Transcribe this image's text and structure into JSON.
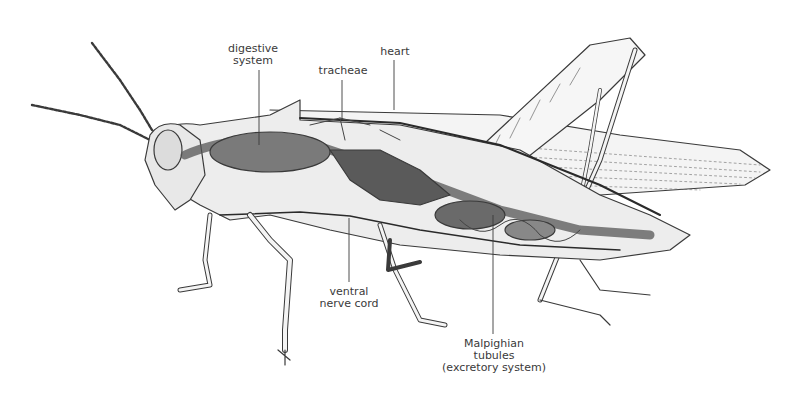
{
  "diagram": {
    "colors": {
      "background": "#ffffff",
      "ink": "#3a3a3a",
      "organ_dark": "#4a4a4a",
      "organ_mid": "#8a8a8a",
      "body_fill": "#efefef"
    },
    "labels": [
      {
        "id": "digestive",
        "lines": [
          "digestive",
          "system"
        ],
        "x": 253,
        "y": 43,
        "leader": {
          "x1": 259,
          "y1": 70,
          "x2": 259,
          "y2": 145
        }
      },
      {
        "id": "tracheae",
        "lines": [
          "tracheae"
        ],
        "x": 343,
        "y": 65,
        "leader": {
          "x1": 342,
          "y1": 80,
          "x2": 342,
          "y2": 120
        }
      },
      {
        "id": "heart",
        "lines": [
          "heart"
        ],
        "x": 395,
        "y": 46,
        "leader": {
          "x1": 394,
          "y1": 60,
          "x2": 394,
          "y2": 110
        }
      },
      {
        "id": "ventral_nerve",
        "lines": [
          "ventral",
          "nerve cord"
        ],
        "x": 349,
        "y": 288,
        "leader": {
          "x1": 349,
          "y1": 218,
          "x2": 349,
          "y2": 282
        }
      },
      {
        "id": "malpighian",
        "lines": [
          "Malpighian",
          "tubules",
          "(excretory system)"
        ],
        "x": 494,
        "y": 340,
        "leader": {
          "x1": 493,
          "y1": 215,
          "x2": 493,
          "y2": 334
        }
      }
    ]
  }
}
